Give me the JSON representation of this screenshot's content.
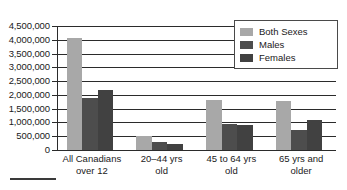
{
  "chart_data": {
    "type": "bar",
    "title": "",
    "subtitle": "",
    "xlabel": "",
    "ylabel": "",
    "grid": true,
    "legend_position": "top-right",
    "ylim": [
      0,
      4500000
    ],
    "ytick_step": 500000,
    "ytick_labels": [
      "4,500,000",
      "4,000,000",
      "3,500,000",
      "3,000,000",
      "2,500,000",
      "2,000,000",
      "1,500,000",
      "1,000,000",
      "500,000",
      "0"
    ],
    "ytick_values": [
      4500000,
      4000000,
      3500000,
      3000000,
      2500000,
      2000000,
      1500000,
      1000000,
      500000,
      0
    ],
    "categories": [
      "All Canadians over 12",
      "20–44 yrs old",
      "45 to 64 yrs old",
      "65 yrs and older"
    ],
    "category_lines": [
      [
        "All Canadians",
        "over 12"
      ],
      [
        "20–44 yrs",
        "old"
      ],
      [
        "45 to 64 yrs",
        "old"
      ],
      [
        "65 yrs and",
        "older"
      ]
    ],
    "series": [
      {
        "name": "Both Sexes",
        "color": "#a8a8a8",
        "values": [
          4050000,
          500000,
          1820000,
          1780000
        ]
      },
      {
        "name": "Males",
        "color": "#4d4d4d",
        "values": [
          1900000,
          290000,
          930000,
          710000
        ]
      },
      {
        "name": "Females",
        "color": "#414141",
        "values": [
          2170000,
          230000,
          920000,
          1080000
        ]
      }
    ]
  },
  "legend": {
    "items": [
      {
        "label": "Both Sexes",
        "swatch": "both"
      },
      {
        "label": "Males",
        "swatch": "male"
      },
      {
        "label": "Females",
        "swatch": "female"
      }
    ]
  }
}
